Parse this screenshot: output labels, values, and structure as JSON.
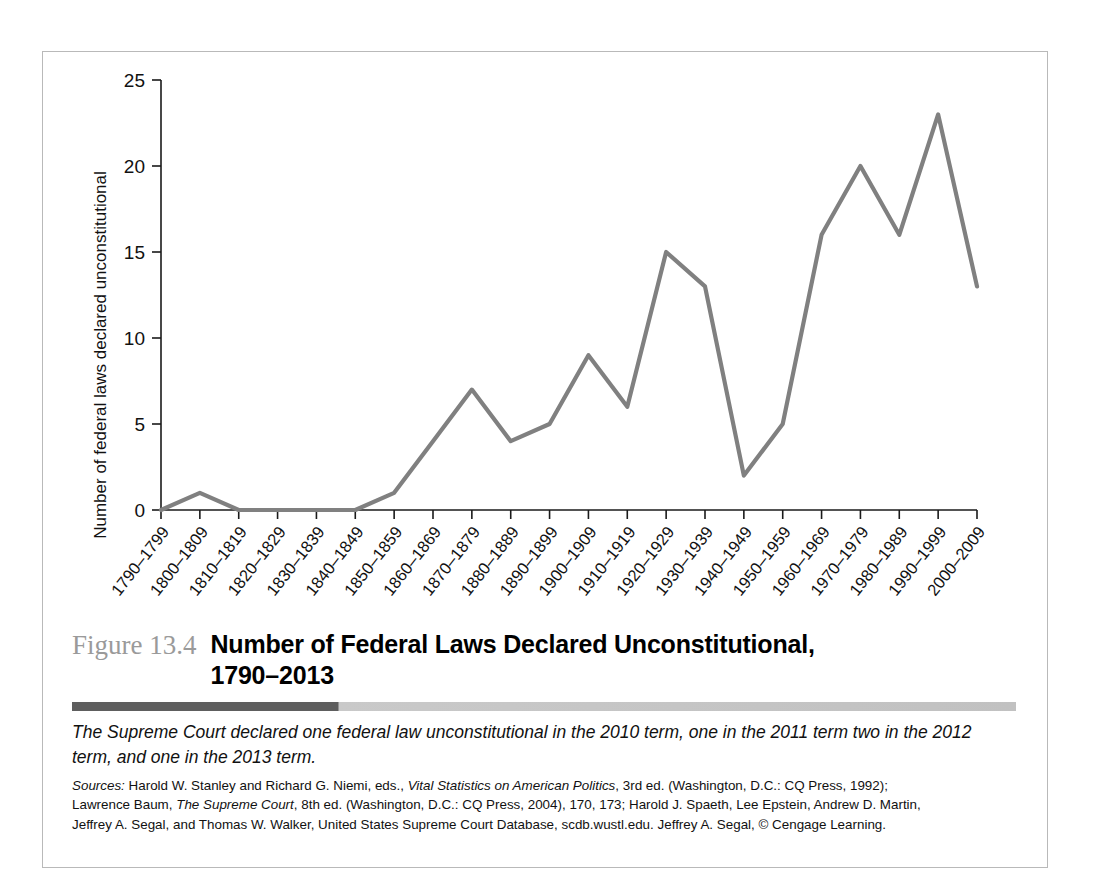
{
  "figure": {
    "number": "Figure 13.4",
    "title_line1": "Number of Federal Laws Declared Unconstitutional,",
    "title_line2": "1790–2013",
    "note": "The Supreme Court declared one federal law unconstitutional in the 2010 term, one in the 2011 term two in the 2012 term, and one in the 2013 term.",
    "sources_label": "Sources:",
    "sources_line1_a": " Harold W. Stanley and Richard G. Niemi, eds., ",
    "sources_line1_italic": "Vital Statistics on American Politics",
    "sources_line1_b": ", 3rd ed. (Washington, D.C.: CQ Press, 1992);",
    "sources_line2_a": "Lawrence Baum, ",
    "sources_line2_italic": "The Supreme Court",
    "sources_line2_b": ", 8th ed. (Washington, D.C.: CQ Press, 2004), 170, 173; Harold J. Spaeth, Lee Epstein, Andrew D. Martin,",
    "sources_line3": "Jeffrey A. Segal, and Thomas W. Walker, United States Supreme Court Database, scdb.wustl.edu. Jeffrey A. Segal, © Cengage Learning."
  },
  "colors": {
    "line": "#808080",
    "axis": "#1a1a1a",
    "figure_number": "#9a9a9a",
    "rule_dark": "#5e5e5e",
    "rule_light": "#c5c5c5",
    "frame_border": "#b9b9b9"
  },
  "chart_data": {
    "type": "line",
    "title": "Number of Federal Laws Declared Unconstitutional, 1790–2013",
    "xlabel": "",
    "ylabel": "Number of federal laws declared unconstitutional",
    "ylim": [
      0,
      25
    ],
    "yticks": [
      0,
      5,
      10,
      15,
      20,
      25
    ],
    "grid": false,
    "legend": "none",
    "categories": [
      "1790–1799",
      "1800–1809",
      "1810–1819",
      "1820–1829",
      "1830–1839",
      "1840–1849",
      "1850–1859",
      "1860–1869",
      "1870–1879",
      "1880–1889",
      "1890–1899",
      "1900–1909",
      "1910–1919",
      "1920–1929",
      "1930–1939",
      "1940–1949",
      "1950–1959",
      "1960–1969",
      "1970–1979",
      "1980–1989",
      "1990–1999",
      "2000–2009"
    ],
    "values": [
      0,
      1,
      0,
      0,
      0,
      0,
      1,
      4,
      7,
      4,
      5,
      9,
      6,
      15,
      13,
      2,
      5,
      16,
      20,
      16,
      23,
      13
    ]
  }
}
